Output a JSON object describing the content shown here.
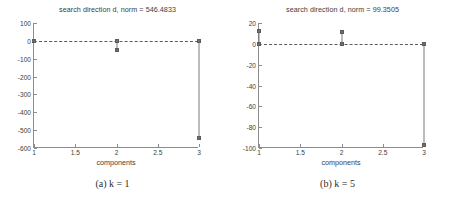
{
  "figure": {
    "xlabel": "components",
    "caption_a": "(a) k = 1",
    "caption_b": "(b) k = 5"
  },
  "chart_data": [
    {
      "type": "bar",
      "id": "panel-a",
      "title": "search direction d, norm = 546.4833",
      "xlabel": "components",
      "ylabel": "",
      "caption": "(a) k = 1",
      "categories": [
        1,
        2,
        3
      ],
      "values": [
        0,
        -50,
        -545
      ],
      "x": [
        1,
        2,
        3
      ],
      "xlim": [
        1,
        3
      ],
      "ylim": [
        -600,
        100
      ],
      "xticks": [
        "1",
        "1.5",
        "2",
        "2.5",
        "3"
      ],
      "xtick_values": [
        1,
        1.5,
        2,
        2.5,
        3
      ],
      "yticks": [
        "100",
        "0",
        "-100",
        "-200",
        "-300",
        "-400",
        "-500",
        "-600"
      ],
      "ytick_values": [
        100,
        0,
        -100,
        -200,
        -300,
        -400,
        -500,
        -600
      ],
      "grid": false,
      "legend": null,
      "baseline": 0,
      "marker": "square",
      "series_color": "#6e6e6e"
    },
    {
      "type": "bar",
      "id": "panel-b",
      "title": "search direction d, norm = 99.3505",
      "xlabel": "components",
      "ylabel": "",
      "caption": "(b) k = 5",
      "categories": [
        1,
        2,
        3
      ],
      "values": [
        12,
        11,
        -97
      ],
      "x": [
        1,
        2,
        3
      ],
      "xlim": [
        1,
        3
      ],
      "ylim": [
        -100,
        20
      ],
      "xticks": [
        "1",
        "1.5",
        "2",
        "2.5",
        "3"
      ],
      "xtick_values": [
        1,
        1.5,
        2,
        2.5,
        3
      ],
      "yticks": [
        "20",
        "0",
        "-20",
        "-40",
        "-60",
        "-80",
        "-100"
      ],
      "ytick_values": [
        20,
        0,
        -20,
        -40,
        -60,
        -80,
        -100
      ],
      "grid": false,
      "legend": null,
      "baseline": 0,
      "marker": "square",
      "series_color": "#6e6e6e"
    }
  ]
}
